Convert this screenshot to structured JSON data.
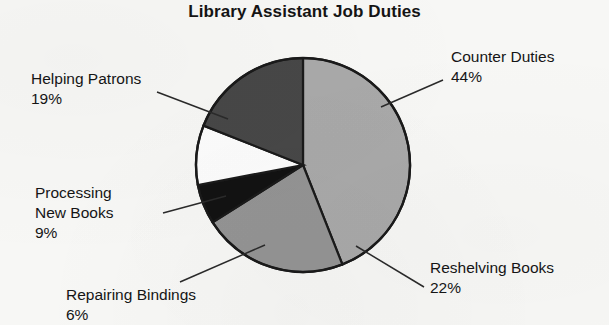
{
  "chart_data": {
    "type": "pie",
    "title": "Library Assistant Job Duties",
    "xlabel": "",
    "ylabel": "",
    "legend_position": "callout-labels",
    "grid": false,
    "categories": [
      "Counter Duties",
      "Reshelving Books",
      "Repairing Bindings",
      "Processing New Books",
      "Helping Patrons"
    ],
    "values": [
      44,
      22,
      6,
      9,
      19
    ],
    "value_suffix": "%",
    "slices": [
      {
        "label": "Counter Duties",
        "value": 44,
        "value_label": "44%",
        "color": "#a9a9a9",
        "start_angle": 0,
        "end_angle": 158.4
      },
      {
        "label": "Reshelving Books",
        "value": 22,
        "value_label": "22%",
        "color": "#949494",
        "start_angle": 158.4,
        "end_angle": 237.6
      },
      {
        "label": "Repairing Bindings",
        "value": 6,
        "value_label": "6%",
        "color": "#121212",
        "start_angle": 237.6,
        "end_angle": 259.2
      },
      {
        "label": "Processing New Books",
        "value": 9,
        "value_label": "9%",
        "color": "#fdfdfd",
        "start_angle": 259.2,
        "end_angle": 291.6
      },
      {
        "label": "Helping Patrons",
        "value": 19,
        "value_label": "19%",
        "color": "#474747",
        "start_angle": 291.6,
        "end_angle": 360
      }
    ]
  },
  "labels": {
    "counter_duties": {
      "name": "Counter Duties",
      "pct": "44%"
    },
    "reshelving_books": {
      "name": "Reshelving Books",
      "pct": "22%"
    },
    "repairing_bindings": {
      "name": "Repairing Bindings",
      "pct": "6%"
    },
    "processing_new_books": {
      "name": "Processing",
      "name2": "New Books",
      "pct": "9%"
    },
    "helping_patrons": {
      "name": "Helping Patrons",
      "pct": "19%"
    }
  },
  "style": {
    "background": "#f7f7f5",
    "outline": "#1a1a1a",
    "text": "#151515",
    "leader_line": "#2a2a2a"
  }
}
